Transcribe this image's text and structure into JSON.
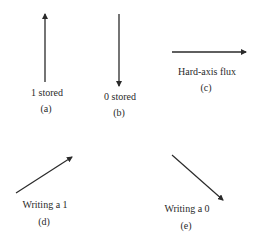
{
  "panels": [
    {
      "id": "a",
      "caption": "1 stored",
      "tag": "(a)",
      "direction": "up"
    },
    {
      "id": "b",
      "caption": "0 stored",
      "tag": "(b)",
      "direction": "down"
    },
    {
      "id": "c",
      "caption": "Hard-axis flux",
      "tag": "(c)",
      "direction": "right"
    },
    {
      "id": "d",
      "caption": "Writing a 1",
      "tag": "(d)",
      "direction": "up-right"
    },
    {
      "id": "e",
      "caption": "Writing a 0",
      "tag": "(e)",
      "direction": "down-right"
    }
  ],
  "colors": {
    "arrow": "#2a2a2a",
    "background": "#ffffff"
  }
}
